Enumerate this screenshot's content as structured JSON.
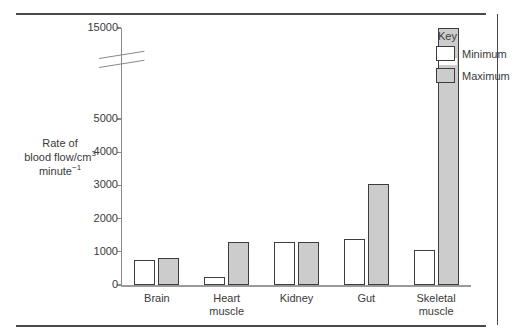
{
  "chart_data": {
    "type": "bar",
    "title": "",
    "xlabel": "",
    "ylabel": "Rate of blood flow/cm³ minute⁻¹",
    "ylabel_line1": "Rate of",
    "ylabel_line2_pre": "blood flow/cm",
    "ylabel_line2_sup": "3",
    "ylabel_line3_pre": "minute",
    "ylabel_line3_sup": "−1",
    "categories": [
      "Brain",
      "Heart muscle",
      "Kidney",
      "Gut",
      "Skeletal muscle"
    ],
    "category_lines": [
      "Brain",
      "Heart\nmuscle",
      "Kidney",
      "Gut",
      "Skeletal\nmuscle"
    ],
    "series": [
      {
        "name": "Minimum",
        "values": [
          750,
          250,
          1300,
          1400,
          1050
        ],
        "color": "#ffffff"
      },
      {
        "name": "Maximum",
        "values": [
          800,
          1300,
          1300,
          3050,
          15000
        ],
        "color": "#cccccc"
      }
    ],
    "ylim": [
      0,
      15000
    ],
    "yticks": [
      0,
      1000,
      2000,
      3000,
      4000,
      5000,
      15000
    ],
    "ytick_labels": [
      "0",
      "1000",
      "2000",
      "3000",
      "4000",
      "5000",
      "15000"
    ],
    "axis_break": {
      "between": [
        5000,
        15000
      ],
      "style": "double-slash"
    },
    "grid": false,
    "legend": {
      "title": "Key",
      "position": "top-right",
      "entries": [
        "Minimum",
        "Maximum"
      ]
    }
  },
  "legend": {
    "title": "Key",
    "minimum_label": "Minimum",
    "maximum_label": "Maximum"
  },
  "colors": {
    "minimum_fill": "#ffffff",
    "maximum_fill": "#cccccc",
    "bar_stroke": "#3d3d3d",
    "axis": "#8a8a8a",
    "rule": "#4a4a4a",
    "text": "#3a3a3a"
  }
}
